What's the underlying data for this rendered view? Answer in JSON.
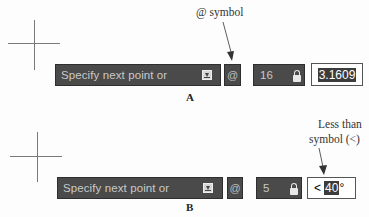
{
  "figure_a": {
    "label": "A",
    "annotation": "@ symbol",
    "prompt": "Specify next point or",
    "at_symbol": "@",
    "distance": "16",
    "value": "3.1609"
  },
  "figure_b": {
    "label": "B",
    "annotation_line1": "Less than",
    "annotation_line2": "symbol (<)",
    "prompt": "Specify next point or",
    "at_symbol": "@",
    "distance": "5",
    "angle_prefix": "<",
    "angle_value": "40",
    "angle_suffix": "°"
  },
  "icons": {
    "download": "download-arrow-icon",
    "lock": "padlock-icon",
    "crosshair": "crosshair-cursor"
  },
  "colors": {
    "box_bg": "#4a4a4a",
    "box_text": "#c9c9c9",
    "selected_bg": "#3c3c3c"
  }
}
